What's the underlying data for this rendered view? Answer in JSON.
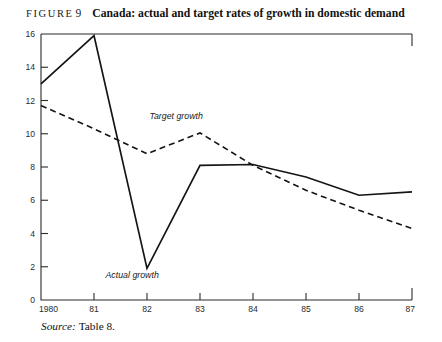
{
  "figure": {
    "label": "FIGURE",
    "number": "9",
    "caption": "Canada: actual and target rates of growth in domestic demand"
  },
  "source": {
    "word": "Source:",
    "reference": "Table 8."
  },
  "chart_data": {
    "type": "line",
    "title": "Canada: actual and target rates of growth in domestic demand",
    "xlabel": "",
    "ylabel": "",
    "x": [
      "1980",
      "81",
      "82",
      "83",
      "84",
      "85",
      "86",
      "87"
    ],
    "xtick_labels": [
      "1980",
      "81",
      "82",
      "83",
      "84",
      "85",
      "86",
      "87"
    ],
    "ytick_labels": [
      "0",
      "2",
      "4",
      "6",
      "8",
      "10",
      "12",
      "14",
      "16"
    ],
    "yticks": [
      0,
      2,
      4,
      6,
      8,
      10,
      12,
      14,
      16
    ],
    "ylim": [
      0,
      16
    ],
    "grid": false,
    "legend": "inline-annotations",
    "series": [
      {
        "name": "Actual growth",
        "style": "solid",
        "color": "#141414",
        "values": [
          13.0,
          15.9,
          1.9,
          8.1,
          8.15,
          7.4,
          6.3,
          6.5
        ],
        "annotation": "Actual growth"
      },
      {
        "name": "Target growth",
        "style": "dashed",
        "color": "#141414",
        "values": [
          11.7,
          10.3,
          8.8,
          10.05,
          8.1,
          6.6,
          5.4,
          4.3
        ],
        "annotation": "Target growth"
      }
    ],
    "annotations": [
      {
        "text": "Target growth",
        "x_index": 2.55,
        "y_value": 10.9
      },
      {
        "text": "Actual growth",
        "x_index": 1.72,
        "y_value": 1.35
      }
    ]
  }
}
